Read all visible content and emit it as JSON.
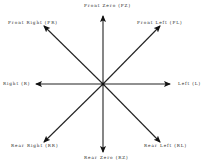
{
  "diagram": {
    "type": "direction-compass",
    "center": {
      "x": 103,
      "y": 84
    },
    "line_color": "#222222",
    "labels": {
      "front": "Front Zero (FZ)",
      "front_right": "Front Right (FR)",
      "front_left": "Front Left (FL)",
      "right": "Right (R)",
      "left": "Left (L)",
      "rear_right": "Rear Right (RR)",
      "rear_left": "Rear Left (RL)",
      "rear": "Rear Zero (RZ)"
    },
    "arrows": [
      {
        "name": "front",
        "x2": 103,
        "y2": 15
      },
      {
        "name": "rear",
        "x2": 103,
        "y2": 153
      },
      {
        "name": "right",
        "x2": 35,
        "y2": 84
      },
      {
        "name": "left",
        "x2": 171,
        "y2": 84
      },
      {
        "name": "front_right",
        "x2": 43,
        "y2": 25
      },
      {
        "name": "front_left",
        "x2": 161,
        "y2": 25
      },
      {
        "name": "rear_right",
        "x2": 43,
        "y2": 143
      },
      {
        "name": "rear_left",
        "x2": 161,
        "y2": 143
      }
    ]
  }
}
